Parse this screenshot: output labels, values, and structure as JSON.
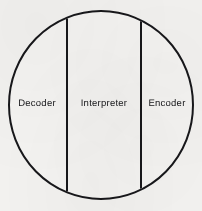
{
  "diagram": {
    "type": "circle-three-vertical-partitions",
    "colors": {
      "background": "#f2f1ef",
      "stroke": "#17171a",
      "fill": "#f4f3f1",
      "text": "#17171a"
    },
    "circle": {
      "center_x": 101,
      "center_y": 105,
      "radius_x": 92,
      "radius_y": 94,
      "stroke_width": 2
    },
    "dividers": [
      {
        "name": "left-divider",
        "x": 67,
        "stroke_width": 2
      },
      {
        "name": "right-divider",
        "x": 141,
        "stroke_width": 2
      }
    ],
    "regions": [
      {
        "id": "decoder",
        "label": "Decoder"
      },
      {
        "id": "interpreter",
        "label": "Interpreter"
      },
      {
        "id": "encoder",
        "label": "Encoder"
      }
    ]
  }
}
